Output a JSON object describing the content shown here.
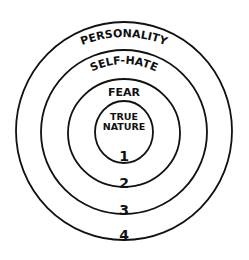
{
  "diagram": {
    "rings": [
      {
        "level": 1,
        "label": "TRUE NATURE",
        "label_lines": [
          "TRUE",
          "NATURE"
        ],
        "number": "1"
      },
      {
        "level": 2,
        "label": "FEAR",
        "number": "2"
      },
      {
        "level": 3,
        "label": "SELF-HATE",
        "number": "3"
      },
      {
        "level": 4,
        "label": "PERSONALITY",
        "number": "4"
      }
    ],
    "stroke_color": "#111111",
    "background": "#ffffff"
  }
}
